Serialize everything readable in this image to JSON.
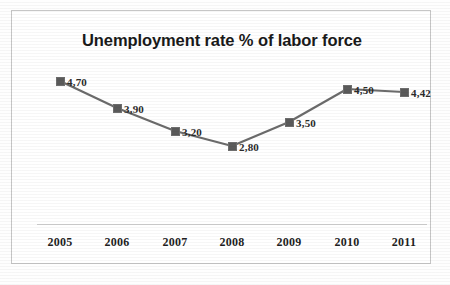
{
  "chart_data": {
    "type": "line",
    "title": "Unemployment rate % of labor force",
    "xlabel": "",
    "ylabel": "",
    "categories": [
      "2005",
      "2006",
      "2007",
      "2008",
      "2009",
      "2010",
      "2011"
    ],
    "values": [
      4.7,
      3.9,
      3.2,
      2.8,
      3.5,
      4.5,
      4.42
    ],
    "data_labels": [
      "4,70",
      "3,90",
      "3,20",
      "2,80",
      "3,50",
      "4,50",
      "4,42"
    ],
    "decimal_separator": ",",
    "ylim": [
      0,
      5
    ],
    "grid": false,
    "legend": false,
    "legend_position": "none",
    "series": [
      {
        "name": "Unemployment rate",
        "values": [
          4.7,
          3.9,
          3.2,
          2.8,
          3.5,
          4.5,
          4.42
        ],
        "marker": "square",
        "marker_color": "#5a5a5a",
        "line_color": "#6b6b6b"
      }
    ],
    "colors": {
      "line": "#6b6b6b",
      "marker": "#5a5a5a",
      "title_text": "#1a1a1a",
      "label_text": "#2b2b2b",
      "axis_line": "#cfcfcf",
      "frame_border": "#c6c6c6",
      "background": "#ffffff"
    },
    "points": [
      {
        "category": "2005",
        "value": 4.7,
        "label": "4,70",
        "x": 48,
        "y": 70
      },
      {
        "category": "2006",
        "value": 3.9,
        "label": "3,90",
        "x": 105,
        "y": 97
      },
      {
        "category": "2007",
        "value": 3.2,
        "label": "3,20",
        "x": 163,
        "y": 120
      },
      {
        "category": "2008",
        "value": 2.8,
        "label": "2,80",
        "x": 220,
        "y": 135
      },
      {
        "category": "2009",
        "value": 3.5,
        "label": "3,50",
        "x": 277,
        "y": 111
      },
      {
        "category": "2010",
        "value": 4.5,
        "label": "4,50",
        "x": 335,
        "y": 78
      },
      {
        "category": "2011",
        "value": 4.42,
        "label": "4,42",
        "x": 392,
        "y": 81
      }
    ],
    "axis_ticks": [
      {
        "label": "2005",
        "x": 48
      },
      {
        "label": "2006",
        "x": 105
      },
      {
        "label": "2007",
        "x": 163
      },
      {
        "label": "2008",
        "x": 220
      },
      {
        "label": "2009",
        "x": 277
      },
      {
        "label": "2010",
        "x": 335
      },
      {
        "label": "2011",
        "x": 392
      }
    ]
  }
}
